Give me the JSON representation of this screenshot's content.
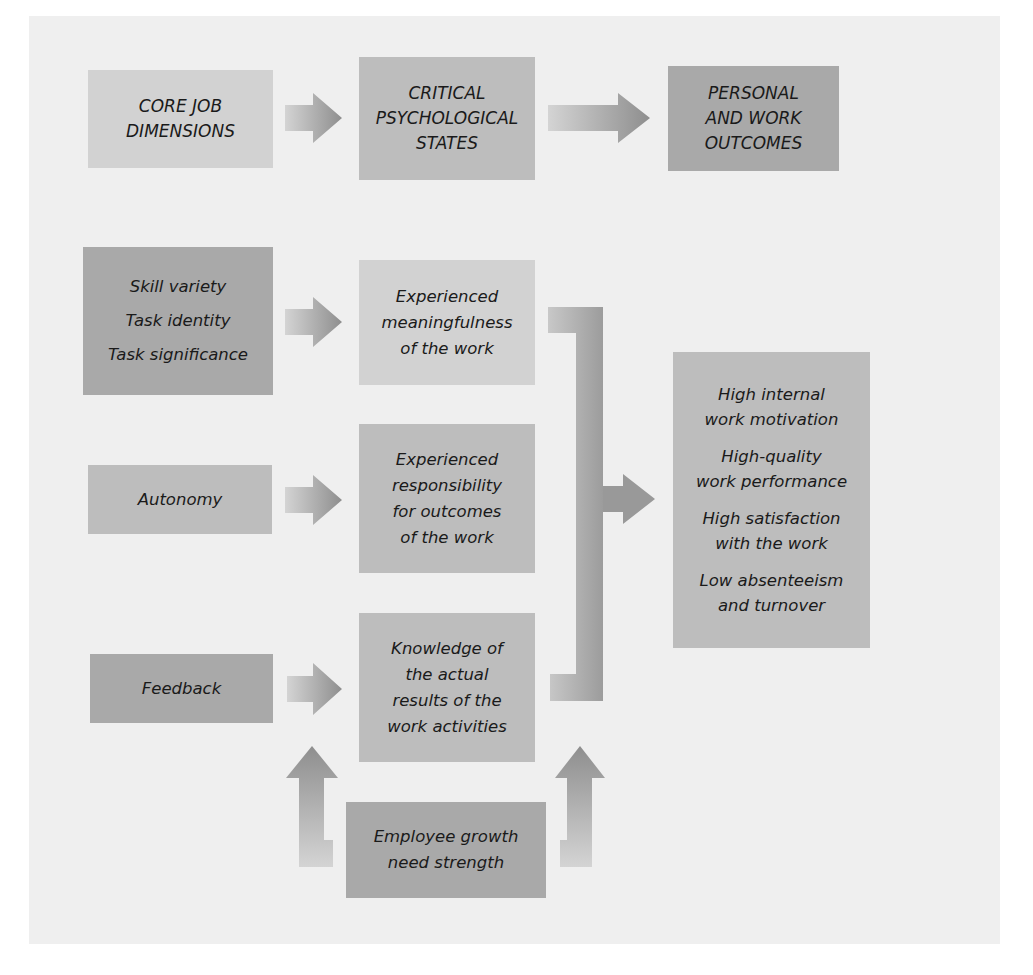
{
  "diagram": {
    "header": {
      "core": [
        "CORE JOB",
        "DIMENSIONS"
      ],
      "critical": [
        "CRITICAL",
        "PSYCHOLOGICAL",
        "STATES"
      ],
      "outcomes": [
        "PERSONAL",
        "AND WORK",
        "OUTCOMES"
      ]
    },
    "dimensions": {
      "group1": [
        "Skill variety",
        "Task identity",
        "Task significance"
      ],
      "autonomy": "Autonomy",
      "feedback": "Feedback"
    },
    "states": {
      "meaningfulness": [
        "Experienced",
        "meaningfulness",
        "of the work"
      ],
      "responsibility": [
        "Experienced",
        "responsibility",
        "for outcomes",
        "of the work"
      ],
      "knowledge": [
        "Knowledge of",
        "the actual",
        "results of the",
        "work activities"
      ]
    },
    "outcomes": [
      [
        "High internal",
        "work motivation"
      ],
      [
        "High-quality",
        "work performance"
      ],
      [
        "High satisfaction",
        "with the work"
      ],
      [
        "Low absenteeism",
        "and turnover"
      ]
    ],
    "moderator": [
      "Employee growth",
      "need strength"
    ],
    "colors": {
      "panel": "#efefef",
      "box_light": "#d2d2d2",
      "box_mid": "#bdbdbd",
      "box_dark": "#a9a9a9",
      "arrow": "#9a9a9a"
    }
  }
}
